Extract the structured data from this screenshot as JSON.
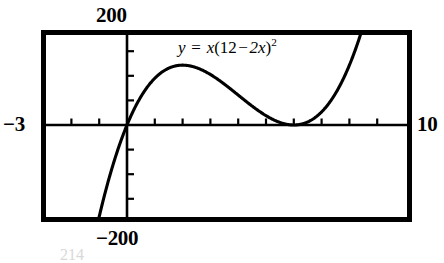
{
  "figure": {
    "kind": "graphing-calculator-plot",
    "equation": {
      "lhs": "y",
      "equals": "=",
      "rhs_coefficient": "x",
      "open_paren": "(",
      "constant": "12",
      "minus": "−",
      "linear_term": "2x",
      "close_paren": ")",
      "exponent": "2",
      "plain": "y = x(12 − 2x)²"
    },
    "axis_labels": {
      "y_max": "200",
      "y_min": "−200",
      "x_min": "−3",
      "x_max": "10"
    },
    "smudge_text": "214"
  },
  "chart_data": {
    "type": "line",
    "title": "",
    "subtitle": "",
    "xlabel": "",
    "ylabel": "",
    "annotations": [
      "y = x(12 − 2x)²"
    ],
    "legend": [],
    "legend_position": "none",
    "grid": false,
    "xlim": [
      -3,
      10
    ],
    "ylim": [
      -200,
      200
    ],
    "xticks": [
      -3,
      -2,
      -1,
      0,
      1,
      2,
      3,
      4,
      5,
      6,
      7,
      8,
      9,
      10
    ],
    "yticks": [
      -200,
      -150,
      -100,
      -50,
      0,
      50,
      100,
      150,
      200
    ],
    "xtick_labels": [
      "−3",
      "",
      "",
      "",
      "",
      "",
      "",
      "",
      "",
      "",
      "",
      "",
      "",
      "10"
    ],
    "ytick_labels": [
      "−200",
      "",
      "",
      "",
      "",
      "",
      "",
      "",
      "200"
    ],
    "roots": [
      0,
      6
    ],
    "local_max": {
      "x": 2,
      "y": 128
    },
    "local_min": {
      "x": 6,
      "y": 0
    },
    "series": [
      {
        "name": "y = x(12 - 2x)^2",
        "color": "#000000",
        "x": [
          -3,
          -2.8,
          -2.6,
          -2.4,
          -2.2,
          -2,
          -1.8,
          -1.6,
          -1.4,
          -1.2,
          -1,
          -0.8,
          -0.6,
          -0.4,
          -0.2,
          0,
          0.25,
          0.5,
          0.75,
          1,
          1.25,
          1.5,
          1.75,
          2,
          2.25,
          2.5,
          2.75,
          3,
          3.25,
          3.5,
          3.75,
          4,
          4.25,
          4.5,
          4.75,
          5,
          5.25,
          5.5,
          5.75,
          6,
          6.25,
          6.5,
          6.75,
          7,
          7.25,
          7.5,
          7.75,
          8,
          8.25,
          8.5,
          8.75,
          9,
          9.25,
          9.5,
          9.75,
          10
        ],
        "y": [
          -972,
          -864.64,
          -762.944,
          -666.624,
          -575.456,
          -489.216,
          -407.68,
          -330.624,
          -257.824,
          -189.056,
          -124,
          -62.464,
          -4.224,
          50.944,
          103.168,
          128,
          139.5625,
          121,
          114.1875,
          100,
          90.3125,
          81,
          72.1875,
          64,
          56.0625,
          49,
          41.8125,
          36,
          29.8125,
          25,
          20.0625,
          16,
          12.1875,
          9,
          6.1875,
          4,
          2.0625,
          1,
          0.1875,
          0,
          0.1875,
          1,
          2.0625,
          4,
          6.1875,
          9,
          12.1875,
          16,
          20.0625,
          25,
          30.1875,
          36,
          42.1875,
          49,
          56.1875,
          64
        ]
      }
    ]
  }
}
